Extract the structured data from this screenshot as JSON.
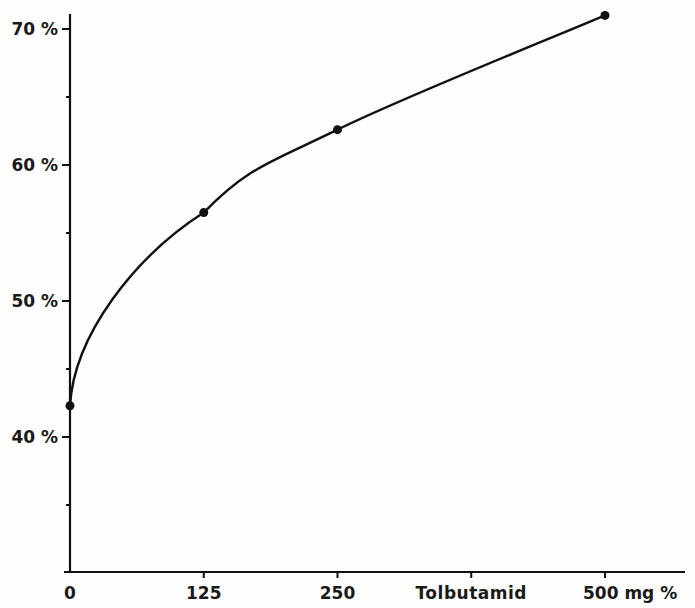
{
  "chart_data": {
    "type": "line",
    "title": "",
    "xlabel": "Tolbutamid",
    "xlabel_unit": "mg %",
    "ylabel": "",
    "x": [
      0,
      125,
      250,
      500
    ],
    "series": [
      {
        "name": "Response",
        "values": [
          42.3,
          56.5,
          62.6,
          71.0
        ]
      }
    ],
    "xlim": [
      0,
      500
    ],
    "ylim": [
      30,
      72
    ],
    "x_ticks": [
      0,
      125,
      250,
      375,
      500
    ],
    "x_tick_labels": [
      "0",
      "125",
      "250",
      "Tolbutamid",
      "500 mg %"
    ],
    "y_ticks": [
      40,
      50,
      60,
      70
    ],
    "y_tick_labels": [
      "40 %",
      "50 %",
      "60 %",
      "70 %"
    ],
    "y_minor_ticks": [
      35,
      45,
      55,
      65
    ],
    "grid": false,
    "legend": null,
    "line_color": "#111111",
    "marker": "filled-circle"
  }
}
